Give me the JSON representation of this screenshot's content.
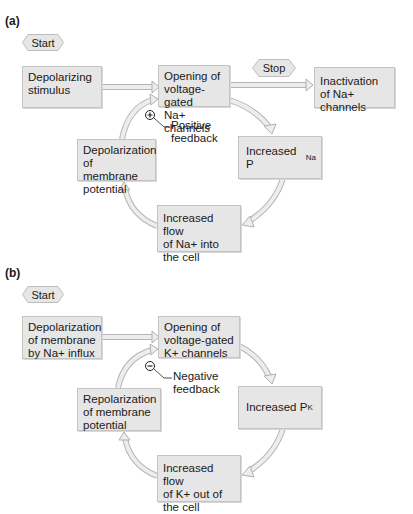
{
  "panel_a": {
    "label": "(a)",
    "start": "Start",
    "stop": "Stop",
    "boxes": {
      "stimulus": [
        "Depolarizing",
        "stimulus"
      ],
      "opening": [
        "Opening of",
        "voltage-gated",
        "Na+ channels"
      ],
      "inactivation": [
        "Inactivation",
        "of Na+ channels"
      ],
      "depolarization": [
        "Depolarization",
        "of membrane",
        "potential"
      ],
      "increased_p": {
        "text": "Increased P",
        "subscript": "Na"
      },
      "increased_flow": [
        "Increased flow",
        "of Na+ into",
        "the cell"
      ]
    },
    "feedback": {
      "symbol": "+",
      "lines": [
        "Positive",
        "feedback"
      ]
    }
  },
  "panel_b": {
    "label": "(b)",
    "start": "Start",
    "boxes": {
      "stimulus": [
        "Depolarization",
        "of membrane",
        "by Na+ influx"
      ],
      "opening": [
        "Opening of",
        "voltage-gated",
        "K+ channels"
      ],
      "repolarization": [
        "Repolarization",
        "of membrane",
        "potential"
      ],
      "increased_p": {
        "text": "Increased P",
        "subscript": "K"
      },
      "increased_flow": [
        "Increased flow",
        "of K+ out of",
        "the cell"
      ]
    },
    "feedback": {
      "symbol": "−",
      "lines": [
        "Negative",
        "feedback"
      ]
    }
  },
  "colors": {
    "box_fill": "#e6e6e6",
    "box_border": "#c4c4c4",
    "arrow_fill": "#ececec",
    "arrow_stroke": "#b8b8b8",
    "text": "#1a1a1a"
  }
}
